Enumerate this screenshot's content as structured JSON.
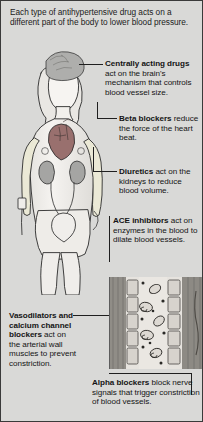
{
  "diagram": {
    "intro": "Each type of antihypertensive drug acts on a different part of the body to lower blood pressure.",
    "callouts": {
      "central": {
        "title": "Centrally acting drugs",
        "body": " act on the brain's mechanism that controls blood vessel size."
      },
      "beta": {
        "title": "Beta blockers",
        "body": " reduce the force of the heart beat."
      },
      "diuretics": {
        "title": "Diuretics",
        "body": " act on the kidneys to reduce blood volume."
      },
      "ace": {
        "title": "ACE inhibitors",
        "body": " act on enzymes in the blood to dilate blood vessels."
      },
      "vasodilators": {
        "title": "Vasodilators and calcium channel blockers",
        "body": " act on the arterial wall muscles to prevent constriction."
      },
      "alpha": {
        "title": "Alpha blockers",
        "body": " block nerve signals that trigger constriction of blood vessels."
      }
    },
    "illustration": {
      "subject": "female-body-anatomical-outline",
      "organs": [
        "brain",
        "heart",
        "kidneys",
        "bladder",
        "blood-vessel-cross-section"
      ]
    },
    "colors": {
      "background": "#d9d9d7",
      "border": "#3a3a3a",
      "text": "#1c1c1c",
      "line": "#1f1f1f",
      "skin": "#f2f0ed",
      "organ_shade": "#a8a8a6",
      "heart": "#8e8e8c",
      "vessel_wall": "#8d8a84",
      "vessel_lumen": "#e4e2de"
    }
  }
}
